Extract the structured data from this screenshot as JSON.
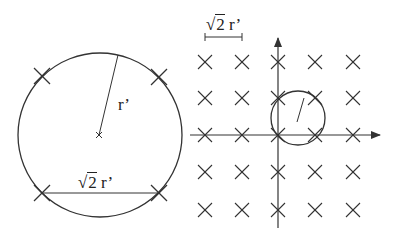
{
  "diagram": {
    "left_panel": {
      "circle": {
        "cx": 100,
        "cy": 135,
        "r": 82
      },
      "center_mark": {
        "x": 99,
        "y": 135
      },
      "radius_line_end": {
        "x": 118,
        "y": 55
      },
      "radius_label": "r’",
      "crosses": [
        {
          "x": 42,
          "y": 76
        },
        {
          "x": 159,
          "y": 77
        },
        {
          "x": 42,
          "y": 193
        },
        {
          "x": 159,
          "y": 193
        }
      ],
      "chord": {
        "x1": 42,
        "y1": 193,
        "x2": 159,
        "y2": 193
      },
      "chord_label": {
        "radical": "√",
        "arg": "2",
        "suffix": " r’"
      }
    },
    "right_panel": {
      "scale_bar": {
        "x1": 205,
        "x2": 242,
        "y": 37
      },
      "scale_label": {
        "radical": "√",
        "arg": "2",
        "suffix": " r’"
      },
      "grid_columns": [
        205,
        242,
        278,
        315,
        353
      ],
      "grid_rows": [
        62,
        98,
        135,
        172,
        210
      ],
      "axes": {
        "origin": {
          "x": 278,
          "y": 135
        },
        "x_axis": {
          "from": 190,
          "to": 380
        },
        "y_axis": {
          "from": 228,
          "to": 38
        }
      },
      "small_circle": {
        "cx": 298,
        "cy": 118,
        "r": 27
      },
      "small_radius_line": {
        "x1": 297,
        "y1": 122,
        "x2": 304,
        "y2": 98
      }
    },
    "colors": {
      "stroke": "#333333",
      "text": "#222222",
      "background": "#ffffff"
    }
  }
}
